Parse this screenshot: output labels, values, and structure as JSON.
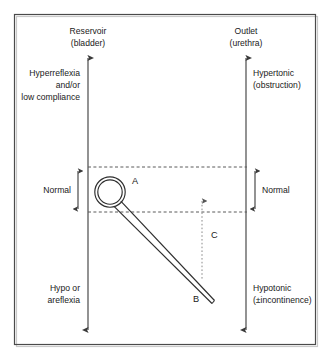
{
  "figure": {
    "background_color": "#ffffff",
    "line_color": "#3a3a3a",
    "text_color": "#1a1a1a"
  },
  "axes": {
    "left": {
      "name": "reservoir-axis",
      "top_label_line1": "Reservoir",
      "top_label_line2": "(bladder)",
      "upper_label_line1": "Hyperreflexia",
      "upper_label_line2": "and/or",
      "upper_label_line3": "low compliance",
      "lower_label_line1": "Hypo or",
      "lower_label_line2": "areflexia"
    },
    "right": {
      "name": "outlet-axis",
      "top_label_line1": "Outlet",
      "top_label_line2": "(urethra)",
      "upper_label_line1": "Hypertonic",
      "upper_label_line2": "(obstruction)",
      "lower_label_line1": "Hypotonic",
      "lower_label_line2": "(±incontinence)"
    }
  },
  "bands": {
    "left_normal_label": "Normal",
    "right_normal_label": "Normal"
  },
  "markers": {
    "a": "A",
    "b": "B",
    "c": "C"
  }
}
